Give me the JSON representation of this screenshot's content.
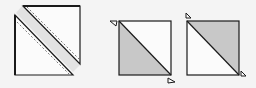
{
  "diagram": {
    "colors": {
      "background": "#f4f4f4",
      "fabric_light": "#fbfbfb",
      "fabric_dark": "#c8c8c8",
      "seam_strip": "#e2e2e2",
      "outline": "#1a1a1a",
      "stitch": "#555555"
    },
    "steps": [
      {
        "id": "step-sew-cut",
        "label": "Two squares sewn with diagonal seams, cut apart"
      },
      {
        "id": "step-unit-a",
        "label": "Pressed half-square unit, dark lower-left",
        "dark_half": "lower-left"
      },
      {
        "id": "step-unit-b",
        "label": "Pressed half-square unit, dark upper-right",
        "dark_half": "upper-right"
      }
    ]
  }
}
